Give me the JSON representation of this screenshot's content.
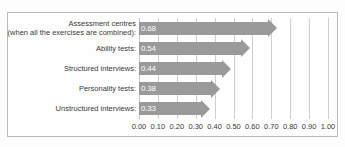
{
  "chart_data": {
    "type": "bar",
    "orientation": "horizontal",
    "title": "",
    "subtitle": "",
    "xlabel": "",
    "ylabel": "",
    "xlim": [
      0.0,
      1.0
    ],
    "xtick_step": 0.1,
    "grid": true,
    "legend": false,
    "legend_position": "none",
    "bar_style": "arrow",
    "categories": [
      "Assessment centres (when all the exercises are combined):",
      "Ability tests:",
      "Structured interviews:",
      "Personality tests:",
      "Unstructured interviews:"
    ],
    "values": [
      0.68,
      0.54,
      0.44,
      0.38,
      0.33
    ],
    "bars": [
      {
        "label_line1": "Assessment centres",
        "label_line2": "(when all the exercises are combined):",
        "value": 0.68,
        "value_label": "0.68"
      },
      {
        "label_line1": "Ability tests:",
        "label_line2": "",
        "value": 0.54,
        "value_label": "0.54"
      },
      {
        "label_line1": "Structured interviews:",
        "label_line2": "",
        "value": 0.44,
        "value_label": "0.44"
      },
      {
        "label_line1": "Personality tests:",
        "label_line2": "",
        "value": 0.38,
        "value_label": "0.38"
      },
      {
        "label_line1": "Unstructured interviews:",
        "label_line2": "",
        "value": 0.33,
        "value_label": "0.33"
      }
    ],
    "xticks": [
      0.0,
      0.1,
      0.2,
      0.3,
      0.4,
      0.5,
      0.6,
      0.7,
      0.8,
      0.9,
      1.0
    ],
    "xtick_labels": [
      "0.00",
      "0.10",
      "0.20",
      "0.30",
      "0.40",
      "0.50",
      "0.60",
      "0.70",
      "0.80",
      "0.90",
      "1.00"
    ]
  },
  "colors": {
    "bar": "#9a9a9a",
    "value_text": "#ffffff",
    "gridline": "#cfcfcf",
    "frame": "#b9b9b9",
    "label_text": "#3a3a3a",
    "background": "#fefefe"
  }
}
